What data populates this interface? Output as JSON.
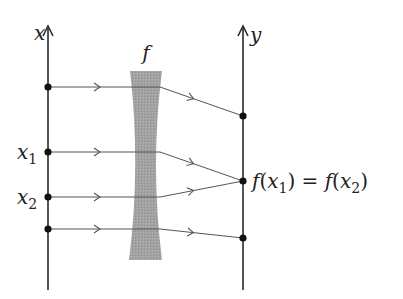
{
  "diagram": {
    "domain_axis": {
      "label": "x"
    },
    "codomain_axis": {
      "label": "y"
    },
    "function": {
      "label": "f",
      "lens_color": "#a3a3a3"
    },
    "domain_points": [
      {
        "id": "p0",
        "label": ""
      },
      {
        "id": "p1",
        "label": "x",
        "sub": "1"
      },
      {
        "id": "p2",
        "label": "x",
        "sub": "2"
      },
      {
        "id": "p3",
        "label": ""
      }
    ],
    "codomain_points": [
      {
        "id": "q0",
        "label": ""
      },
      {
        "id": "q1",
        "label_parts": [
          "f(",
          "x",
          "1",
          ") = f(",
          "x",
          "2",
          ")"
        ]
      },
      {
        "id": "q2",
        "label": ""
      }
    ],
    "mappings": [
      {
        "from": "p0",
        "to": "q0"
      },
      {
        "from": "p1",
        "to": "q1"
      },
      {
        "from": "p2",
        "to": "q1"
      },
      {
        "from": "p3",
        "to": "q2"
      }
    ],
    "colors": {
      "axis": "#2a2a2a",
      "ray": "#555555",
      "dot": "#111111",
      "lens": "#a3a3a3"
    }
  }
}
